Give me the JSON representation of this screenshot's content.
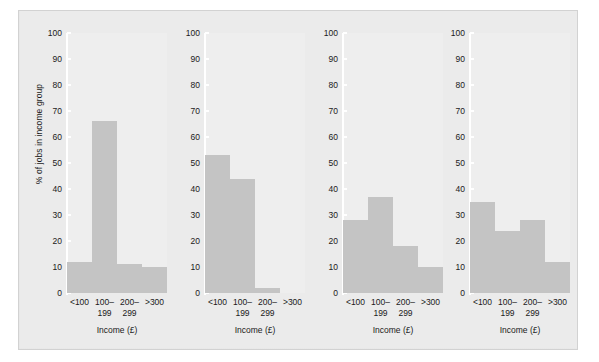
{
  "figure": {
    "ylabel": "% of jobs in income group",
    "xlabel": "Income (£)",
    "bar_color": "#c4c4c4",
    "panel_background": "#eeeeee",
    "figure_background": "#ebebeb"
  },
  "yticks": [
    "100",
    "90",
    "80",
    "70",
    "60",
    "50",
    "40",
    "30",
    "20",
    "10",
    "0"
  ],
  "xticks": [
    "<100",
    "100–\n199",
    "200–\n299",
    ">300"
  ],
  "panels": [
    {
      "title": "Manufacturing,\nMetal goods,\nEngineering",
      "values": [
        12,
        66,
        11,
        10
      ]
    },
    {
      "title": "Distribution,\nShops, Hotels,\nCatering",
      "values": [
        53,
        44,
        2,
        0
      ]
    },
    {
      "title": "Banking,\nFinance,\nInsurance",
      "values": [
        28,
        37,
        18,
        10
      ]
    },
    {
      "title": "Other services",
      "values": [
        35,
        24,
        28,
        12
      ]
    }
  ],
  "chart_data": {
    "type": "bar",
    "title": "",
    "subtitle": "",
    "xlabel": "Income (£)",
    "ylabel": "% of jobs in income group",
    "ylim": [
      0,
      100
    ],
    "yticks": [
      0,
      10,
      20,
      30,
      40,
      50,
      60,
      70,
      80,
      90,
      100
    ],
    "grid": false,
    "legend": "none",
    "categories": [
      "<100",
      "100–199",
      "200–299",
      ">300"
    ],
    "panels": [
      {
        "name": "Manufacturing, Metal goods, Engineering",
        "values": [
          12,
          66,
          11,
          10
        ]
      },
      {
        "name": "Distribution, Shops, Hotels, Catering",
        "values": [
          53,
          44,
          2,
          0
        ]
      },
      {
        "name": "Banking, Finance, Insurance",
        "values": [
          28,
          37,
          18,
          10
        ]
      },
      {
        "name": "Other services",
        "values": [
          35,
          24,
          28,
          12
        ]
      }
    ]
  }
}
